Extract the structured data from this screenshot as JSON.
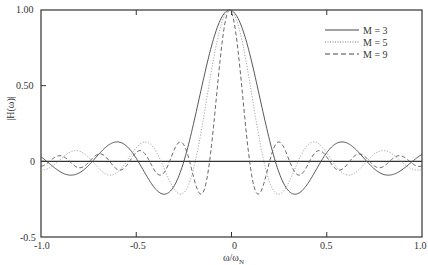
{
  "chart_data": {
    "type": "line",
    "title": "",
    "xlabel": "ω/ω_N",
    "ylabel": "|H(ω)|",
    "xlim": [
      -1.0,
      1.0
    ],
    "ylim": [
      -0.5,
      1.0
    ],
    "grid": false,
    "legend_position": "upper right",
    "x_ticks": [
      "-1.0",
      "-0.5",
      "0",
      "0.5",
      "1.0"
    ],
    "y_ticks": [
      "-0.5",
      "0",
      "0.50",
      "1.00"
    ],
    "x": [
      -1.0,
      -0.9,
      -0.8,
      -0.7,
      -0.6,
      -0.5,
      -0.4,
      -0.3,
      -0.2,
      -0.1,
      0.0,
      0.1,
      0.2,
      0.3,
      0.4,
      0.5,
      0.6,
      0.7,
      0.8,
      0.9,
      1.0
    ],
    "series": [
      {
        "name": "M = 3",
        "style": "solid",
        "zero_width": 0.24,
        "values": [
          0.038,
          -0.06,
          -0.083,
          0.028,
          0.127,
          0.04,
          -0.165,
          -0.18,
          0.191,
          0.738,
          1.0,
          0.738,
          0.191,
          -0.18,
          -0.165,
          0.04,
          0.127,
          0.028,
          -0.083,
          -0.06,
          0.038
        ]
      },
      {
        "name": "M = 5",
        "style": "dotted",
        "zero_width": 0.18,
        "values": [
          -0.056,
          0.0,
          0.071,
          -0.028,
          -0.083,
          0.074,
          0.092,
          -0.165,
          -0.098,
          0.564,
          1.0,
          0.564,
          -0.098,
          -0.165,
          0.092,
          0.074,
          -0.083,
          -0.028,
          0.071,
          0.0,
          -0.056
        ]
      },
      {
        "name": "M = 9",
        "style": "dashed",
        "zero_width": 0.105,
        "values": [
          -0.033,
          0.036,
          -0.039,
          0.041,
          -0.044,
          0.045,
          -0.047,
          0.048,
          -0.049,
          0.05,
          1.0,
          0.05,
          -0.049,
          0.048,
          -0.047,
          0.045,
          -0.044,
          0.041,
          -0.039,
          0.036,
          -0.033
        ]
      }
    ],
    "center_offset": -0.01
  },
  "axes": {
    "xlabel_main": "ω/ω",
    "xlabel_sub": "N",
    "ylabel": "|H(ω)|",
    "y_tick_labels": {
      "top": "1.00",
      "mid": "0.50",
      "zero": "0",
      "bottom": "-0.5"
    },
    "x_tick_labels": {
      "left": "-1.0",
      "ql": "-0.5",
      "center": "0",
      "qr": "0.5",
      "right": "1.0"
    }
  },
  "legend": {
    "items": [
      {
        "label": "M = 3"
      },
      {
        "label": "M = 5"
      },
      {
        "label": "M = 9"
      }
    ]
  },
  "colors": {
    "axis": "#333333",
    "solid": "#444444",
    "dotted": "#9a9a9a",
    "dashed": "#555555"
  }
}
